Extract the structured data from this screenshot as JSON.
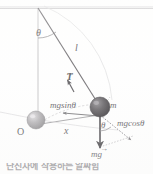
{
  "figure": {
    "caption": "단진자에 작용하는 알짜힘",
    "background_color": "#ffffff",
    "ink_color": "#58565a"
  },
  "labels": {
    "theta_top": "θ",
    "length": "l",
    "tension": "T",
    "tension_vector_hat": "→",
    "mg_sin_theta": "mgsinθ",
    "mass": "m",
    "origin": "O",
    "displacement": "x",
    "theta_bottom": "θ",
    "mg_cos_theta": "mgcosθ",
    "weight": "mg",
    "weight_vector_hat": "→"
  },
  "geometry": {
    "pivot": {
      "x": 38,
      "y": 8
    },
    "ceiling_line": {
      "x1": 0,
      "y1": 8,
      "x2": 153,
      "y2": 8
    },
    "vertical_reference": {
      "x1": 38,
      "y1": 8,
      "x2": 38,
      "y2": 122
    },
    "string": {
      "x1": 38,
      "y1": 8,
      "x2": 100,
      "y2": 107
    },
    "bob_displaced": {
      "cx": 100,
      "cy": 107,
      "r": 10,
      "color": "#4b484c"
    },
    "bob_equilibrium": {
      "cx": 36,
      "cy": 120,
      "r": 9,
      "color": "#9b9a9c"
    },
    "swing_arc": "from pivot radius to both bobs",
    "weight_vector": {
      "x1": 100,
      "y1": 107,
      "x2": 100,
      "y2": 149
    },
    "mg_sin_vector": {
      "x1": 100,
      "y1": 114,
      "x2": 62,
      "y2": 112
    },
    "mg_cos_vector": {
      "x1": 100,
      "y1": 114,
      "x2": 133,
      "y2": 141
    },
    "tension_vector": {
      "x1": 73,
      "y1": 90,
      "x2": 66,
      "y2": 78
    },
    "x_axis": {
      "x1": 36,
      "y1": 124,
      "x2": 100,
      "y2": 115
    }
  },
  "colors": {
    "ink": "#58565a",
    "faint": "#c9c8ca",
    "bob_dark": "#4b484c",
    "bob_light": "#a5a3a6",
    "caption": "#6f6d72"
  }
}
